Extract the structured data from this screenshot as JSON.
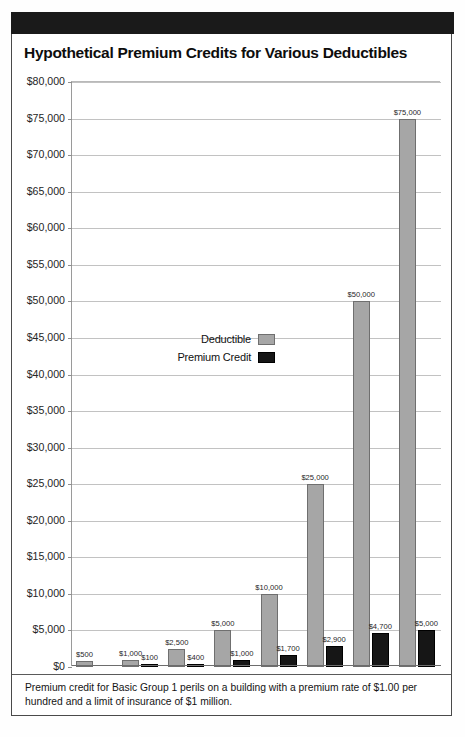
{
  "title": "Hypothetical Premium Credits for Various Deductibles",
  "footnote": "Premium credit for Basic Group 1 perils on a building with a premium rate of $1.00 per hundred and a limit of insurance of $1 million.",
  "bottom_partial_text": "",
  "colors": {
    "deductible_bar": "#a6a6a6",
    "premium_credit_bar": "#161616",
    "header_band": "#1a1a1a",
    "gridline": "#c2c2c2",
    "text": "#1f1f1f"
  },
  "legend": {
    "position": "inside-center-left",
    "entries": [
      {
        "label": "Deductible",
        "swatch": "deductible"
      },
      {
        "label": "Premium Credit",
        "swatch": "premium-credit"
      }
    ]
  },
  "chart_data": {
    "type": "bar",
    "title": "Hypothetical Premium Credits for Various Deductibles",
    "xlabel": "",
    "ylabel": "",
    "ylim": [
      0,
      80000
    ],
    "ytick_step": 5000,
    "grid": true,
    "legend_position": "inside-center-left",
    "ytick_labels": [
      "$0",
      "$5,000",
      "$10,000",
      "$15,000",
      "$20,000",
      "$25,000",
      "$30,000",
      "$35,000",
      "$40,000",
      "$45,000",
      "$50,000",
      "$55,000",
      "$60,000",
      "$65,000",
      "$70,000",
      "$75,000",
      "$80,000"
    ],
    "ytick_values": [
      0,
      5000,
      10000,
      15000,
      20000,
      25000,
      30000,
      35000,
      40000,
      45000,
      50000,
      55000,
      60000,
      65000,
      70000,
      75000,
      80000
    ],
    "categories": [
      "$500",
      "$1,000",
      "$2,500",
      "$5,000",
      "$10,000",
      "$25,000",
      "$50,000",
      "$75,000"
    ],
    "series": [
      {
        "name": "Deductible",
        "values": [
          500,
          1000,
          2500,
          5000,
          10000,
          25000,
          50000,
          75000
        ]
      },
      {
        "name": "Premium Credit",
        "values": [
          0,
          100,
          400,
          1000,
          1700,
          2900,
          4700,
          5000
        ]
      }
    ],
    "point_labels": {
      "Deductible": [
        "$500",
        "$1,000",
        "$2,500",
        "$5,000",
        "$10,000",
        "$25,000",
        "$50,000",
        "$75,000"
      ],
      "Premium Credit": [
        "",
        "$100",
        "$400",
        "$1,000",
        "$1,700",
        "$2,900",
        "$4,700",
        "$5,000"
      ]
    }
  }
}
